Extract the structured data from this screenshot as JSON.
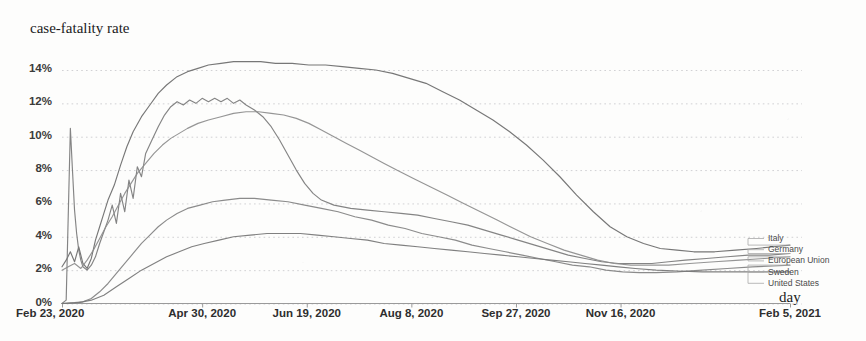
{
  "chart_title": "case-fatality rate",
  "x_axis_title": "day",
  "axes": {
    "y_ticks": [
      "0%",
      "2%",
      "4%",
      "6%",
      "8%",
      "10%",
      "12%",
      "14%"
    ],
    "x_ticks": [
      "Feb 23, 2020",
      "Apr 30, 2020",
      "Jun 19, 2020",
      "Aug 8, 2020",
      "Sep 27, 2020",
      "Nov 16, 2020",
      "Feb 5, 2021"
    ]
  },
  "legend": {
    "items": [
      "Italy",
      "Germany",
      "European Union",
      "Sweden",
      "United States"
    ]
  },
  "chart_data": {
    "type": "line",
    "title": "case-fatality rate",
    "xlabel": "day",
    "ylabel": "case-fatality rate",
    "ylim": [
      0,
      15
    ],
    "grid": true,
    "legend_position": "right",
    "x_tick_labels": [
      "Feb 23, 2020",
      "Apr 30, 2020",
      "Jun 19, 2020",
      "Aug 8, 2020",
      "Sep 27, 2020",
      "Nov 16, 2020",
      "Feb 5, 2021"
    ],
    "x_tick_positions": [
      0,
      67,
      117,
      167,
      217,
      267,
      348
    ],
    "x_unit": "days since Feb 23, 2020",
    "x_range": [
      0,
      348
    ],
    "y_ticks": [
      0,
      2,
      4,
      6,
      8,
      10,
      12,
      14
    ],
    "series": [
      {
        "name": "Italy",
        "color": "#6b6b6b",
        "points": [
          [
            0,
            2.2
          ],
          [
            2,
            2.6
          ],
          [
            4,
            3.1
          ],
          [
            6,
            2.5
          ],
          [
            8,
            3.4
          ],
          [
            10,
            2.4
          ],
          [
            12,
            2.1
          ],
          [
            14,
            2.7
          ],
          [
            16,
            3.8
          ],
          [
            18,
            4.6
          ],
          [
            20,
            5.4
          ],
          [
            22,
            6.2
          ],
          [
            25,
            7.1
          ],
          [
            28,
            8.3
          ],
          [
            31,
            9.4
          ],
          [
            34,
            10.3
          ],
          [
            38,
            11.2
          ],
          [
            42,
            11.9
          ],
          [
            46,
            12.6
          ],
          [
            50,
            13.1
          ],
          [
            55,
            13.6
          ],
          [
            60,
            13.9
          ],
          [
            65,
            14.1
          ],
          [
            70,
            14.3
          ],
          [
            76,
            14.4
          ],
          [
            82,
            14.5
          ],
          [
            88,
            14.5
          ],
          [
            95,
            14.5
          ],
          [
            102,
            14.4
          ],
          [
            110,
            14.4
          ],
          [
            118,
            14.3
          ],
          [
            126,
            14.3
          ],
          [
            134,
            14.2
          ],
          [
            142,
            14.1
          ],
          [
            150,
            14.0
          ],
          [
            158,
            13.8
          ],
          [
            166,
            13.5
          ],
          [
            174,
            13.2
          ],
          [
            182,
            12.7
          ],
          [
            190,
            12.2
          ],
          [
            198,
            11.6
          ],
          [
            206,
            11.0
          ],
          [
            214,
            10.3
          ],
          [
            222,
            9.5
          ],
          [
            230,
            8.6
          ],
          [
            238,
            7.6
          ],
          [
            246,
            6.5
          ],
          [
            254,
            5.5
          ],
          [
            262,
            4.6
          ],
          [
            270,
            4.0
          ],
          [
            278,
            3.6
          ],
          [
            286,
            3.3
          ],
          [
            294,
            3.2
          ],
          [
            302,
            3.1
          ],
          [
            312,
            3.1
          ],
          [
            322,
            3.2
          ],
          [
            332,
            3.3
          ],
          [
            340,
            3.4
          ],
          [
            348,
            3.5
          ]
        ]
      },
      {
        "name": "Germany",
        "color": "#7a7a7a",
        "points": [
          [
            0,
            0.0
          ],
          [
            2,
            0.2
          ],
          [
            4,
            10.5
          ],
          [
            5,
            8.0
          ],
          [
            6,
            5.6
          ],
          [
            7,
            4.2
          ],
          [
            8,
            3.2
          ],
          [
            9,
            2.6
          ],
          [
            10,
            2.2
          ],
          [
            12,
            2.0
          ],
          [
            14,
            2.3
          ],
          [
            16,
            2.8
          ],
          [
            18,
            3.6
          ],
          [
            20,
            4.3
          ],
          [
            22,
            5.0
          ],
          [
            24,
            5.9
          ],
          [
            26,
            4.8
          ],
          [
            28,
            6.6
          ],
          [
            30,
            5.5
          ],
          [
            32,
            7.4
          ],
          [
            34,
            6.3
          ],
          [
            36,
            8.2
          ],
          [
            38,
            7.6
          ],
          [
            40,
            9.0
          ],
          [
            43,
            9.8
          ],
          [
            46,
            10.6
          ],
          [
            49,
            11.3
          ],
          [
            52,
            11.8
          ],
          [
            55,
            12.1
          ],
          [
            58,
            11.9
          ],
          [
            61,
            12.2
          ],
          [
            64,
            12.0
          ],
          [
            67,
            12.3
          ],
          [
            70,
            12.1
          ],
          [
            73,
            12.3
          ],
          [
            76,
            12.1
          ],
          [
            79,
            12.3
          ],
          [
            82,
            12.0
          ],
          [
            85,
            12.2
          ],
          [
            88,
            11.9
          ],
          [
            92,
            11.6
          ],
          [
            96,
            11.2
          ],
          [
            100,
            10.6
          ],
          [
            104,
            9.8
          ],
          [
            108,
            8.9
          ],
          [
            112,
            8.0
          ],
          [
            116,
            7.2
          ],
          [
            120,
            6.6
          ],
          [
            124,
            6.2
          ],
          [
            130,
            5.9
          ],
          [
            138,
            5.7
          ],
          [
            146,
            5.6
          ],
          [
            154,
            5.5
          ],
          [
            162,
            5.4
          ],
          [
            170,
            5.3
          ],
          [
            178,
            5.1
          ],
          [
            186,
            4.9
          ],
          [
            194,
            4.7
          ],
          [
            202,
            4.4
          ],
          [
            210,
            4.1
          ],
          [
            218,
            3.8
          ],
          [
            226,
            3.5
          ],
          [
            234,
            3.2
          ],
          [
            242,
            2.9
          ],
          [
            250,
            2.7
          ],
          [
            258,
            2.5
          ],
          [
            266,
            2.4
          ],
          [
            274,
            2.4
          ],
          [
            282,
            2.4
          ],
          [
            290,
            2.5
          ],
          [
            298,
            2.6
          ],
          [
            308,
            2.7
          ],
          [
            318,
            2.8
          ],
          [
            328,
            2.9
          ],
          [
            338,
            2.9
          ],
          [
            348,
            3.0
          ]
        ]
      },
      {
        "name": "European Union",
        "color": "#8c8c8c",
        "points": [
          [
            0,
            2.0
          ],
          [
            3,
            2.2
          ],
          [
            6,
            2.4
          ],
          [
            9,
            2.1
          ],
          [
            12,
            2.6
          ],
          [
            15,
            3.2
          ],
          [
            18,
            3.9
          ],
          [
            21,
            4.6
          ],
          [
            24,
            5.2
          ],
          [
            27,
            5.9
          ],
          [
            30,
            6.6
          ],
          [
            33,
            7.2
          ],
          [
            36,
            7.8
          ],
          [
            40,
            8.4
          ],
          [
            44,
            9.0
          ],
          [
            48,
            9.5
          ],
          [
            52,
            9.9
          ],
          [
            56,
            10.2
          ],
          [
            60,
            10.5
          ],
          [
            65,
            10.8
          ],
          [
            70,
            11.0
          ],
          [
            76,
            11.2
          ],
          [
            82,
            11.4
          ],
          [
            88,
            11.5
          ],
          [
            94,
            11.5
          ],
          [
            100,
            11.4
          ],
          [
            106,
            11.3
          ],
          [
            112,
            11.1
          ],
          [
            118,
            10.8
          ],
          [
            124,
            10.4
          ],
          [
            130,
            10.0
          ],
          [
            136,
            9.6
          ],
          [
            142,
            9.2
          ],
          [
            148,
            8.8
          ],
          [
            154,
            8.4
          ],
          [
            160,
            8.0
          ],
          [
            168,
            7.5
          ],
          [
            176,
            7.0
          ],
          [
            184,
            6.5
          ],
          [
            192,
            6.0
          ],
          [
            200,
            5.5
          ],
          [
            208,
            5.0
          ],
          [
            216,
            4.5
          ],
          [
            224,
            4.0
          ],
          [
            232,
            3.6
          ],
          [
            240,
            3.2
          ],
          [
            248,
            2.9
          ],
          [
            256,
            2.6
          ],
          [
            264,
            2.4
          ],
          [
            272,
            2.3
          ],
          [
            280,
            2.3
          ],
          [
            290,
            2.3
          ],
          [
            300,
            2.4
          ],
          [
            312,
            2.5
          ],
          [
            324,
            2.6
          ],
          [
            336,
            2.7
          ],
          [
            348,
            2.8
          ]
        ]
      },
      {
        "name": "Sweden",
        "color": "#818181",
        "points": [
          [
            0,
            0.0
          ],
          [
            6,
            0.05
          ],
          [
            10,
            0.1
          ],
          [
            14,
            0.3
          ],
          [
            18,
            0.7
          ],
          [
            22,
            1.2
          ],
          [
            26,
            1.8
          ],
          [
            30,
            2.4
          ],
          [
            34,
            3.0
          ],
          [
            38,
            3.6
          ],
          [
            42,
            4.1
          ],
          [
            46,
            4.6
          ],
          [
            50,
            5.0
          ],
          [
            55,
            5.4
          ],
          [
            60,
            5.7
          ],
          [
            66,
            5.9
          ],
          [
            72,
            6.1
          ],
          [
            78,
            6.2
          ],
          [
            85,
            6.3
          ],
          [
            92,
            6.3
          ],
          [
            100,
            6.2
          ],
          [
            108,
            6.1
          ],
          [
            116,
            5.9
          ],
          [
            124,
            5.7
          ],
          [
            132,
            5.5
          ],
          [
            140,
            5.2
          ],
          [
            148,
            5.0
          ],
          [
            156,
            4.7
          ],
          [
            164,
            4.5
          ],
          [
            172,
            4.2
          ],
          [
            180,
            4.0
          ],
          [
            188,
            3.8
          ],
          [
            196,
            3.5
          ],
          [
            204,
            3.3
          ],
          [
            212,
            3.1
          ],
          [
            220,
            2.9
          ],
          [
            228,
            2.7
          ],
          [
            236,
            2.5
          ],
          [
            244,
            2.3
          ],
          [
            252,
            2.2
          ],
          [
            260,
            2.0
          ],
          [
            268,
            1.9
          ],
          [
            276,
            1.85
          ],
          [
            284,
            1.85
          ],
          [
            294,
            1.9
          ],
          [
            306,
            2.0
          ],
          [
            318,
            2.1
          ],
          [
            330,
            2.2
          ],
          [
            340,
            2.25
          ],
          [
            348,
            2.3
          ]
        ]
      },
      {
        "name": "United States",
        "color": "#757575",
        "points": [
          [
            0,
            0.0
          ],
          [
            8,
            0.05
          ],
          [
            14,
            0.2
          ],
          [
            20,
            0.5
          ],
          [
            26,
            1.0
          ],
          [
            32,
            1.5
          ],
          [
            38,
            2.0
          ],
          [
            44,
            2.4
          ],
          [
            50,
            2.8
          ],
          [
            56,
            3.1
          ],
          [
            62,
            3.4
          ],
          [
            68,
            3.6
          ],
          [
            75,
            3.8
          ],
          [
            82,
            4.0
          ],
          [
            90,
            4.1
          ],
          [
            98,
            4.2
          ],
          [
            106,
            4.2
          ],
          [
            114,
            4.2
          ],
          [
            122,
            4.1
          ],
          [
            130,
            4.0
          ],
          [
            138,
            3.9
          ],
          [
            146,
            3.8
          ],
          [
            154,
            3.6
          ],
          [
            162,
            3.5
          ],
          [
            170,
            3.4
          ],
          [
            178,
            3.3
          ],
          [
            186,
            3.2
          ],
          [
            194,
            3.1
          ],
          [
            202,
            3.0
          ],
          [
            210,
            2.9
          ],
          [
            218,
            2.8
          ],
          [
            226,
            2.7
          ],
          [
            234,
            2.6
          ],
          [
            242,
            2.5
          ],
          [
            250,
            2.4
          ],
          [
            258,
            2.3
          ],
          [
            266,
            2.2
          ],
          [
            274,
            2.1
          ],
          [
            284,
            2.0
          ],
          [
            294,
            1.95
          ],
          [
            306,
            1.9
          ],
          [
            318,
            1.9
          ],
          [
            330,
            1.9
          ],
          [
            340,
            1.9
          ],
          [
            348,
            1.9
          ]
        ]
      }
    ]
  }
}
